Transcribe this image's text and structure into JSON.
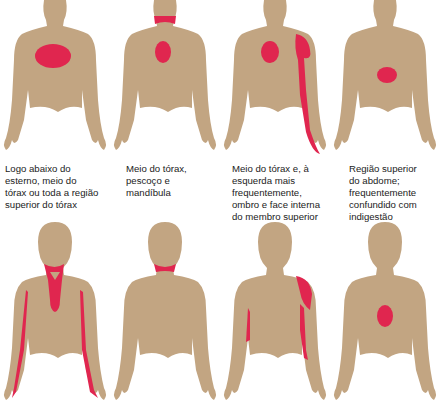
{
  "colors": {
    "skin": "#c2a582",
    "pain": "#e0264f",
    "background": "#ffffff",
    "text": "#222222"
  },
  "figures": [
    {
      "id": "fig1",
      "row": 1,
      "col": 1,
      "view": "front",
      "caption": "Logo abaixo do\nesterno, meio do\ntórax ou toda a região\nsuperior do tórax"
    },
    {
      "id": "fig2",
      "row": 1,
      "col": 2,
      "view": "front",
      "caption": "Meio do tórax,\npescoço e\nmandíbula"
    },
    {
      "id": "fig3",
      "row": 1,
      "col": 3,
      "view": "front",
      "caption": "Meio do tórax e, à\nesquerda mais\nfrequentemente,\nombro e face interna\ndo membro superior"
    },
    {
      "id": "fig4",
      "row": 1,
      "col": 4,
      "view": "front",
      "caption": "Região superior\ndo abdome;\nfrequentemente\nconfundido com\nindigestão"
    },
    {
      "id": "fig5",
      "row": 2,
      "col": 1,
      "view": "front",
      "caption": ""
    },
    {
      "id": "fig6",
      "row": 2,
      "col": 2,
      "view": "front",
      "caption": ""
    },
    {
      "id": "fig7",
      "row": 2,
      "col": 3,
      "view": "front",
      "caption": ""
    },
    {
      "id": "fig8",
      "row": 2,
      "col": 4,
      "view": "back",
      "caption": ""
    }
  ],
  "partial_captions_cut_off": [
    "...",
    "Mandíbula...",
    "Ombro, braço...",
    "Entre as duas..."
  ]
}
